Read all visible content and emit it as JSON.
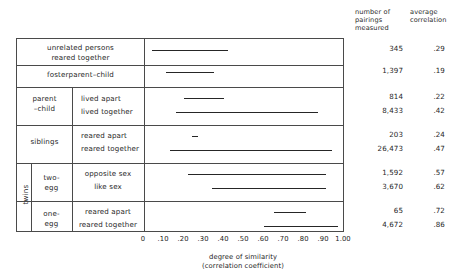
{
  "columns": {
    "pairings_header": "number of\npairings\nmeasured",
    "pairings_header_l1": "number of",
    "pairings_header_l2": "pairings",
    "pairings_header_l3": "measured",
    "correlation_header_l1": "average",
    "correlation_header_l2": "correlation"
  },
  "axis": {
    "title_line1": "degree of similarity",
    "title_line2": "(correlation coefficient)",
    "min": 0,
    "max": 1.0,
    "ticks": [
      "0",
      ".10",
      ".20",
      ".30",
      ".40",
      ".50",
      ".60",
      ".70",
      ".80",
      ".90",
      "1.00"
    ],
    "tick_values": [
      0,
      0.1,
      0.2,
      0.3,
      0.4,
      0.5,
      0.6,
      0.7,
      0.8,
      0.9,
      1.0
    ]
  },
  "groups": [
    {
      "name": "unrelated persons reared together",
      "group_label": "",
      "sub_label": ""
    },
    {
      "name": "fosterparent-child",
      "group_label": "",
      "sub_label": ""
    },
    {
      "name": "parent-child",
      "group_label": "parent–child",
      "sub_label": ""
    },
    {
      "name": "siblings",
      "group_label": "siblings",
      "sub_label": ""
    },
    {
      "name": "twins two-egg",
      "group_label": "twins",
      "sub_label": "two-egg"
    },
    {
      "name": "twins one-egg",
      "group_label": "twins",
      "sub_label": "one-egg"
    }
  ],
  "labels": {
    "unrelated_l1": "unrelated persons",
    "unrelated_l2": "reared together",
    "fosterparent": "fosterparent–child",
    "parent_l1": "parent",
    "parent_l2": "–child",
    "lived_apart": "lived apart",
    "lived_together": "lived together",
    "siblings": "siblings",
    "reared_apart": "reared apart",
    "reared_together": "reared together",
    "twins": "twins",
    "two_egg_l1": "two-",
    "two_egg_l2": "egg",
    "one_egg_l1": "one-",
    "one_egg_l2": "egg",
    "opposite_sex": "opposite sex",
    "like_sex": "like sex",
    "one_reared_apart": "reared apart",
    "one_reared_together": "reared together"
  },
  "chart_data": {
    "type": "bar",
    "title": "",
    "xlabel": "degree of similarity (correlation coefficient)",
    "ylabel": "",
    "xlim": [
      0,
      1.0
    ],
    "grid": false,
    "legend": "none",
    "orientation": "horizontal-range",
    "note": "Each row is a range bar (min–max of reported correlations) plus a reported average correlation and number of pairings measured.",
    "categories": [
      "unrelated persons reared together",
      "fosterparent–child",
      "parent–child: lived apart",
      "parent–child: lived together",
      "siblings: reared apart",
      "siblings: reared together",
      "two-egg twins: opposite sex",
      "two-egg twins: like sex",
      "one-egg twins: reared apart",
      "one-egg twins: reared together"
    ],
    "rows": [
      {
        "label": "unrelated persons reared together",
        "range_start": 0.04,
        "range_end": 0.42,
        "pairings": "345",
        "correlation": ".29"
      },
      {
        "label": "fosterparent–child",
        "range_start": 0.11,
        "range_end": 0.35,
        "pairings": "1,397",
        "correlation": ".19"
      },
      {
        "label": "lived apart",
        "range_start": 0.2,
        "range_end": 0.4,
        "pairings": "814",
        "correlation": ".22"
      },
      {
        "label": "lived together",
        "range_start": 0.16,
        "range_end": 0.87,
        "pairings": "8,433",
        "correlation": ".42"
      },
      {
        "label": "reared apart",
        "range_start": 0.24,
        "range_end": 0.27,
        "pairings": "203",
        "correlation": ".24"
      },
      {
        "label": "reared together",
        "range_start": 0.13,
        "range_end": 0.94,
        "pairings": "26,473",
        "correlation": ".47"
      },
      {
        "label": "opposite sex",
        "range_start": 0.22,
        "range_end": 0.91,
        "pairings": "1,592",
        "correlation": ".57"
      },
      {
        "label": "like sex",
        "range_start": 0.34,
        "range_end": 0.91,
        "pairings": "3,670",
        "correlation": ".62"
      },
      {
        "label": "reared apart",
        "range_start": 0.65,
        "range_end": 0.81,
        "pairings": "65",
        "correlation": ".72"
      },
      {
        "label": "reared together",
        "range_start": 0.6,
        "range_end": 0.97,
        "pairings": "4,672",
        "correlation": ".86"
      }
    ]
  }
}
